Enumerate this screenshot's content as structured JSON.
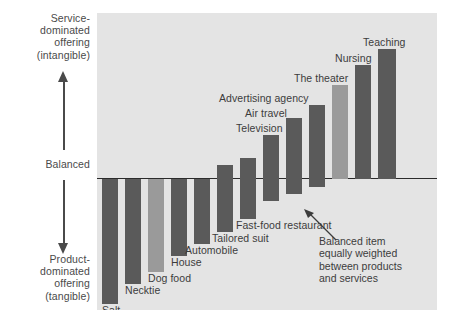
{
  "axis": {
    "top_label": "Service-\ndominated\noffering\n(intangible)",
    "middle_label": "Balanced",
    "bottom_label": "Product-\ndominated\noffering\n(tangible)",
    "up_arrow_icon": "up-arrow-icon",
    "down_arrow_icon": "down-arrow-icon"
  },
  "annotation": {
    "text": "Balanced item\nequally weighted\nbetween products\nand services",
    "pointer_icon": "callout-arrow-icon"
  },
  "colors": {
    "panel_bg": "#e4e4e4",
    "bar_dark": "#5a5a5a",
    "bar_light": "#9a9a9a",
    "axis_line": "#2b2b2b",
    "text": "#3c3c3c"
  },
  "chart_data": {
    "type": "bar",
    "title": "",
    "subtitle": "",
    "xlabel": "",
    "ylabel": "Service-dominated offering (intangible) / Balanced / Product-dominated offering (tangible)",
    "orientation": "vertical",
    "grid": false,
    "legend": "none",
    "ylim": [
      -100,
      100
    ],
    "zero_label": "Balanced",
    "categories": [
      "Salt",
      "Necktie",
      "Dog food",
      "House",
      "Automobile",
      "Tailored suit",
      "Fast-food restaurant",
      "Television",
      "Air travel",
      "Advertising agency",
      "The theater",
      "Nursing",
      "Teaching"
    ],
    "values": [
      -84,
      -67,
      -60,
      -44,
      -35,
      -22,
      -10,
      6,
      22,
      38,
      52,
      70,
      86
    ],
    "bar_tops": [
      -84,
      -67,
      -60,
      14,
      26,
      42,
      50,
      58,
      68,
      74,
      82,
      88,
      94
    ],
    "bar_bottoms": [
      -84,
      -67,
      -60,
      -44,
      -35,
      -22,
      -10,
      -14,
      -22,
      -30,
      -22,
      0,
      0
    ],
    "series": [
      {
        "name": "Goods-services continuum",
        "values": [
          -84,
          -67,
          -60,
          -44,
          -35,
          -22,
          -10,
          6,
          22,
          38,
          52,
          70,
          86
        ]
      }
    ],
    "annotations": [
      {
        "target": "Fast-food restaurant",
        "text": "Balanced item equally weighted between products and services"
      }
    ]
  },
  "bars": [
    {
      "label": "Salt",
      "tone": "dark",
      "x": 5,
      "w": 16,
      "top": 166,
      "bot": 291,
      "lx": 5,
      "ly": 292,
      "anchor": "left"
    },
    {
      "label": "Necktie",
      "tone": "dark",
      "x": 28,
      "w": 16,
      "top": 166,
      "bot": 271,
      "lx": 28,
      "ly": 272,
      "anchor": "left"
    },
    {
      "label": "Dog food",
      "tone": "light",
      "x": 51,
      "w": 16,
      "top": 166,
      "bot": 259,
      "lx": 51,
      "ly": 260,
      "anchor": "left"
    },
    {
      "label": "House",
      "tone": "dark",
      "x": 74,
      "w": 16,
      "top": 166,
      "bot": 243,
      "lx": 74,
      "ly": 244,
      "anchor": "left"
    },
    {
      "label": "Automobile",
      "tone": "dark",
      "x": 97,
      "w": 16,
      "top": 166,
      "bot": 231,
      "lx": 88,
      "ly": 232,
      "anchor": "left"
    },
    {
      "label": "Tailored suit",
      "tone": "dark",
      "x": 120,
      "w": 16,
      "top": 152,
      "bot": 219,
      "lx": 115,
      "ly": 220,
      "anchor": "left"
    },
    {
      "label": "Fast-food restaurant",
      "tone": "dark",
      "x": 143,
      "w": 16,
      "top": 145,
      "bot": 206,
      "lx": 139,
      "ly": 207,
      "anchor": "left"
    },
    {
      "label": "Television",
      "tone": "dark",
      "x": 166,
      "w": 16,
      "top": 122,
      "bot": 188,
      "lx": 139,
      "ly": 110,
      "anchor": "left"
    },
    {
      "label": "Air travel",
      "tone": "dark",
      "x": 189,
      "w": 16,
      "top": 105,
      "bot": 181,
      "lx": 148,
      "ly": 95,
      "anchor": "left"
    },
    {
      "label": "Advertising agency",
      "tone": "dark",
      "x": 212,
      "w": 16,
      "top": 92,
      "bot": 174,
      "lx": 122,
      "ly": 80,
      "anchor": "left"
    },
    {
      "label": "The theater",
      "tone": "light",
      "x": 235,
      "w": 16,
      "top": 72,
      "bot": 166,
      "lx": 197,
      "ly": 60,
      "anchor": "left"
    },
    {
      "label": "Nursing",
      "tone": "dark",
      "x": 258,
      "w": 16,
      "top": 52,
      "bot": 166,
      "lx": 238,
      "ly": 40,
      "anchor": "left"
    },
    {
      "label": "Teaching",
      "tone": "dark",
      "x": 281,
      "w": 18,
      "top": 36,
      "bot": 166,
      "lx": 266,
      "ly": 24,
      "anchor": "left"
    }
  ]
}
